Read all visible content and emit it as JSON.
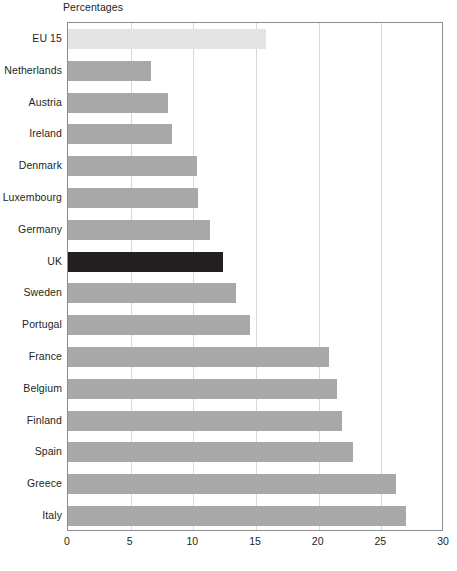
{
  "chart_data": {
    "type": "bar",
    "orientation": "horizontal",
    "title": "Percentages",
    "xlabel": "",
    "ylabel": "",
    "xlim": [
      0,
      30
    ],
    "xticks": [
      0,
      5,
      10,
      15,
      20,
      25,
      30
    ],
    "grid": true,
    "legend": "none",
    "categories": [
      "EU 15",
      "Netherlands",
      "Austria",
      "Ireland",
      "Denmark",
      "Luxembourg",
      "Germany",
      "UK",
      "Sweden",
      "Portugal",
      "France",
      "Belgium",
      "Finland",
      "Spain",
      "Greece",
      "Italy"
    ],
    "values": [
      15.8,
      6.6,
      8.0,
      8.3,
      10.3,
      10.4,
      11.3,
      12.4,
      13.4,
      14.5,
      20.8,
      21.5,
      21.9,
      22.7,
      26.2,
      27.0
    ],
    "bar_styles": [
      "aggregate",
      "normal",
      "normal",
      "normal",
      "normal",
      "normal",
      "normal",
      "highlight",
      "normal",
      "normal",
      "normal",
      "normal",
      "normal",
      "normal",
      "normal",
      "normal"
    ],
    "colors": {
      "bar": "#a8a8a8",
      "highlight": "#231f20",
      "aggregate": "#e4e4e4",
      "gridline": "#d9d9d9",
      "frame": "#8c8c8c",
      "text": "#231f20",
      "background": "#ffffff"
    }
  }
}
